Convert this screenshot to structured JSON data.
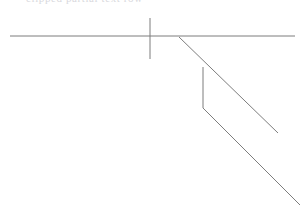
{
  "canvas": {
    "width": 308,
    "height": 212,
    "background_color": "#ffffff",
    "stroke_color": "#7d7d7d",
    "stroke_width": 1
  },
  "header": {
    "clipped_text": "clipped partial text row",
    "visible": true,
    "color": "#b9b9c2"
  },
  "chart_data": {
    "type": "line",
    "title": "",
    "subtitle": "",
    "xlabel": "",
    "ylabel": "",
    "grid": false,
    "legend_position": "none",
    "xlim": [
      0,
      308
    ],
    "ylim": [
      0,
      212
    ],
    "annotations": [],
    "tick_labels": [],
    "series": [
      {
        "name": "horizontal-baseline",
        "stroke": "#7d7d7d",
        "x": [
          10,
          295
        ],
        "y": [
          36,
          36
        ]
      },
      {
        "name": "vertical-tick",
        "stroke": "#7d7d7d",
        "x": [
          150,
          150
        ],
        "y": [
          18,
          59
        ]
      },
      {
        "name": "upper-diagonal",
        "stroke": "#7d7d7d",
        "x": [
          179,
          278
        ],
        "y": [
          37,
          133
        ]
      },
      {
        "name": "vertical-connector",
        "stroke": "#7d7d7d",
        "x": [
          203,
          203
        ],
        "y": [
          67,
          108
        ]
      },
      {
        "name": "lower-diagonal",
        "stroke": "#7d7d7d",
        "x": [
          203,
          300
        ],
        "y": [
          108,
          205
        ]
      }
    ]
  },
  "elements": {
    "horizontal_baseline_label": "horizontal baseline",
    "vertical_tick_label": "vertical tick mark",
    "upper_diagonal_label": "upper diagonal line",
    "vertical_connector_label": "vertical connector segment",
    "lower_diagonal_label": "lower diagonal line"
  }
}
